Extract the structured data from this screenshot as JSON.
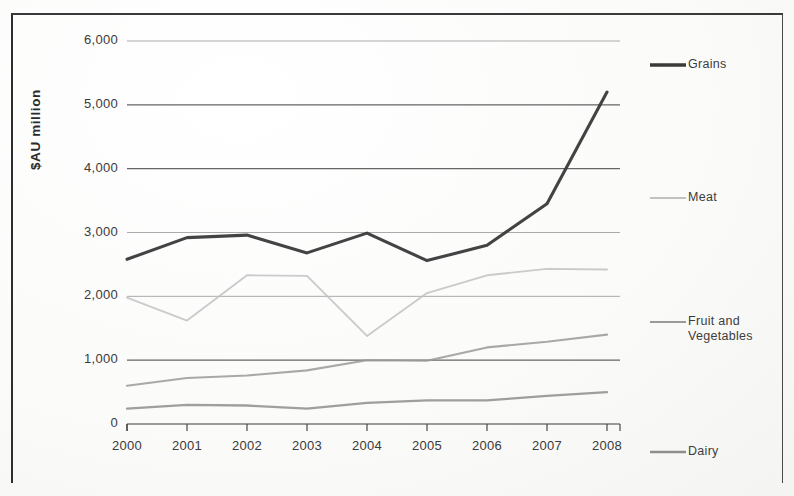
{
  "axis": {
    "ylabel": "$AU million",
    "yticks": [
      "6,000",
      "5,000",
      "4,000",
      "3,000",
      "2,000",
      "1,000",
      "0"
    ],
    "xticks": [
      "2000",
      "2001",
      "2002",
      "2003",
      "2004",
      "2005",
      "2006",
      "2007",
      "2008"
    ]
  },
  "legend": {
    "grains": "Grains",
    "meat": "Meat",
    "fruit_and_vegetables": "Fruit and\nVegetables",
    "dairy": "Dairy"
  },
  "colors": {
    "grains": "#3a3a3a",
    "meat": "#c2c2c2",
    "fruit_and_vegetables": "#9a9a9a",
    "dairy": "#8e8e8e",
    "gridline": "#555555",
    "axis": "#3a3a3a"
  },
  "chart_data": {
    "type": "line",
    "title": "",
    "xlabel": "",
    "ylabel": "$AU million",
    "ylim": [
      0,
      6000
    ],
    "ytick_interval": 1000,
    "grid": true,
    "legend_position": "right",
    "categories": [
      "2000",
      "2001",
      "2002",
      "2003",
      "2004",
      "2005",
      "2006",
      "2007",
      "2008"
    ],
    "series": [
      {
        "name": "Grains",
        "color": "#3a3a3a",
        "values": [
          2580,
          2920,
          2960,
          2680,
          2990,
          2560,
          2800,
          3450,
          5200
        ]
      },
      {
        "name": "Meat",
        "color": "#c2c2c2",
        "values": [
          1980,
          1620,
          2330,
          2320,
          1380,
          2050,
          2330,
          2430,
          2420
        ]
      },
      {
        "name": "Fruit and Vegetables",
        "color": "#9a9a9a",
        "values": [
          600,
          720,
          760,
          840,
          1000,
          990,
          1200,
          1290,
          1400
        ]
      },
      {
        "name": "Dairy",
        "color": "#8e8e8e",
        "values": [
          240,
          300,
          290,
          240,
          330,
          370,
          370,
          440,
          500
        ]
      }
    ]
  }
}
